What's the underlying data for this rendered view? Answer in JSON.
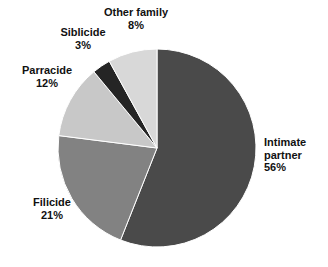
{
  "chart_data": {
    "type": "pie",
    "title": "",
    "subtitle": "",
    "xlabel": "",
    "ylabel": "",
    "legend": "none",
    "grid": false,
    "units": "percent",
    "start_angle_deg": 0,
    "direction": "clockwise",
    "center": {
      "x": 157,
      "y": 148
    },
    "radius": 99,
    "categories": [
      "Intimate partner",
      "Filicide",
      "Parracide",
      "Siblicide",
      "Other family"
    ],
    "values": [
      56,
      21,
      12,
      3,
      8
    ],
    "colors": [
      "#4a4a4a",
      "#828282",
      "#c8c8c8",
      "#252525",
      "#d8d8d8"
    ],
    "slices": [
      {
        "name": "Intimate partner",
        "label_line1": "Intimate",
        "label_line2": "partner",
        "value": 56,
        "value_label": "56%",
        "color": "#4a4a4a",
        "start_deg": 0,
        "end_deg": 201.6
      },
      {
        "name": "Filicide",
        "label_line1": "Filicide",
        "label_line2": "",
        "value": 21,
        "value_label": "21%",
        "color": "#828282",
        "start_deg": 201.6,
        "end_deg": 277.2
      },
      {
        "name": "Parracide",
        "label_line1": "Parracide",
        "label_line2": "",
        "value": 12,
        "value_label": "12%",
        "color": "#c8c8c8",
        "start_deg": 277.2,
        "end_deg": 320.4
      },
      {
        "name": "Siblicide",
        "label_line1": "Siblicide",
        "label_line2": "",
        "value": 3,
        "value_label": "3%",
        "color": "#252525",
        "start_deg": 320.4,
        "end_deg": 331.2
      },
      {
        "name": "Other family",
        "label_line1": "Other family",
        "label_line2": "",
        "value": 8,
        "value_label": "8%",
        "color": "#d8d8d8",
        "start_deg": 331.2,
        "end_deg": 360
      }
    ]
  },
  "labels": {
    "other_family": {
      "name": "Other family",
      "value": "8%"
    },
    "siblicide": {
      "name": "Siblicide",
      "value": "3%"
    },
    "parracide": {
      "name": "Parracide",
      "value": "12%"
    },
    "filicide": {
      "name": "Filicide",
      "value": "21%"
    },
    "intimate_partner": {
      "name_line1": "Intimate",
      "name_line2": "partner",
      "value": "56%"
    }
  },
  "colors": {
    "background": "#ffffff",
    "text": "#111111",
    "slice_intimate_partner": "#4a4a4a",
    "slice_filicide": "#828282",
    "slice_parracide": "#c8c8c8",
    "slice_siblicide": "#252525",
    "slice_other_family": "#d8d8d8",
    "slice_outline": "#ffffff"
  }
}
